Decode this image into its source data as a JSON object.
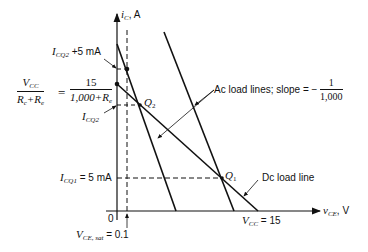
{
  "figure": {
    "y_axis_label": "i",
    "y_axis_label_sub": "C",
    "y_axis_unit": ", A",
    "x_axis_label": "v",
    "x_axis_label_sub": "CE",
    "x_axis_unit": ", V",
    "origin_label": "0"
  },
  "annotations": {
    "icq2_plus": {
      "main": "I",
      "sub": "CQ2",
      "rest": " +5 mA"
    },
    "equation": {
      "lhs_num": "V",
      "lhs_num_sub": "CC",
      "lhs_den": "R",
      "lhs_den_sub1": "c",
      "lhs_den_plus": "+R",
      "lhs_den_sub2": "e",
      "equals": "=",
      "rhs_num": "15",
      "rhs_den": "1,000+R",
      "rhs_den_sub": "e"
    },
    "icq2": {
      "main": "I",
      "sub": "CQ2"
    },
    "icq1": {
      "main": "I",
      "sub": "CQ1",
      "rest": " = 5 mA"
    },
    "q2": {
      "main": "Q",
      "sub": "2"
    },
    "q1": {
      "main": "Q",
      "sub": "1"
    },
    "ac_load_lines": {
      "text": "Ac load lines; slope = −",
      "num": "1",
      "den": "1,000"
    },
    "dc_load_line": "Dc load line",
    "vcc": {
      "main": "V",
      "sub": "CC",
      "rest": " = 15"
    },
    "vce_sat": {
      "main": "V",
      "sub": "CE, sat",
      "rest": " = 0.1"
    }
  }
}
